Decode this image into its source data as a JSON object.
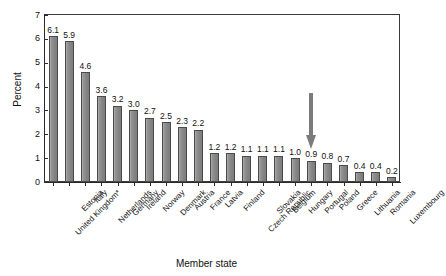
{
  "chart_data": {
    "type": "bar",
    "title": "",
    "xlabel": "Member state",
    "ylabel": "Percent",
    "ylim": [
      0,
      7
    ],
    "ytick_labels": [
      "0",
      "1",
      "2",
      "3",
      "4",
      "5",
      "6",
      "7"
    ],
    "ytick_values": [
      0,
      1,
      2,
      3,
      4,
      5,
      6,
      7
    ],
    "grid": false,
    "legend": null,
    "bar_color": "#8d8d8d",
    "bar_edge_color": "#4a4a4a",
    "categories": [
      "United Kingdom*",
      "Estonia",
      "Italy",
      "Netherlands",
      "Germany",
      "Ireland",
      "Norway",
      "Denmark",
      "Austria",
      "France",
      "Latvia",
      "Finland",
      "Czech Republic",
      "Slovakia",
      "Belgium",
      "Hungary",
      "Portugal",
      "Poland",
      "Greece",
      "Lithuania",
      "Romania",
      "Luxembourg"
    ],
    "values": [
      6.1,
      5.9,
      4.6,
      3.6,
      3.2,
      3.0,
      2.7,
      2.5,
      2.3,
      2.2,
      1.2,
      1.2,
      1.1,
      1.1,
      1.1,
      1.0,
      0.9,
      0.8,
      0.7,
      0.4,
      0.4,
      0.2
    ],
    "value_labels": [
      "6.1",
      "5.9",
      "4.6",
      "3.6",
      "3.2",
      "3.0",
      "2.7",
      "2.5",
      "2.3",
      "2.2",
      "1.2",
      "1.2",
      "1.1",
      "1.1",
      "1.1",
      "1.0",
      "0.9",
      "0.8",
      "0.7",
      "0.4",
      "0.4",
      "0.2"
    ],
    "annotations": [
      {
        "type": "down-arrow",
        "points_to_category": "Portugal",
        "points_to_value": 0.9,
        "color": "#7b7b7b"
      }
    ]
  }
}
